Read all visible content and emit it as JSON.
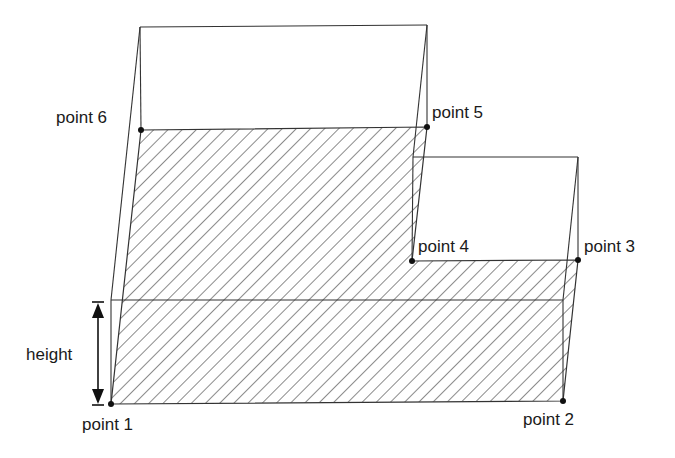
{
  "diagram": {
    "title": "",
    "hatch_color": "#2a2a2a",
    "line_color": "#333333",
    "points": [
      {
        "id": "point1",
        "label": "point 1",
        "x": 111,
        "y": 404,
        "label_x": 84,
        "label_y": 428
      },
      {
        "id": "point2",
        "label": "point 2",
        "x": 563,
        "y": 401,
        "label_x": 523,
        "label_y": 425
      },
      {
        "id": "point3",
        "label": "point 3",
        "x": 578,
        "y": 260,
        "label_x": 584,
        "label_y": 250
      },
      {
        "id": "point4",
        "label": "point 4",
        "x": 412,
        "y": 261,
        "label_x": 418,
        "label_y": 250
      },
      {
        "id": "point5",
        "label": "point 5",
        "x": 427,
        "y": 127,
        "label_x": 432,
        "label_y": 117
      },
      {
        "id": "point6",
        "label": "point 6",
        "x": 141,
        "y": 130,
        "label_x": 56,
        "label_y": 122
      }
    ],
    "height_annotation": {
      "label": "height",
      "label_x": 26,
      "label_y": 360
    }
  }
}
